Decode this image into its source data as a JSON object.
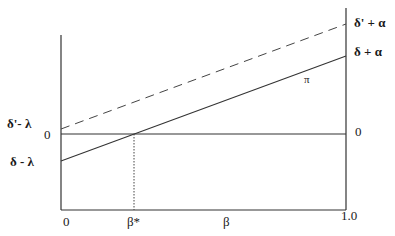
{
  "diagram": {
    "left_labels": {
      "upper": "δ'- λ",
      "zero": "0",
      "lower": "δ - λ"
    },
    "right_labels": {
      "upper": "δ' + α",
      "middle": "δ + α",
      "zero": "0"
    },
    "curve_label": "π",
    "x_axis": {
      "start": "0",
      "marker": "β*",
      "label": "β",
      "end": "1.0"
    },
    "lines": [
      {
        "name": "dashed-line",
        "style": "dashed",
        "from_label": "δ'- λ",
        "to_label": "δ' + α"
      },
      {
        "name": "solid-line-pi",
        "style": "solid",
        "from_label": "δ - λ",
        "to_label": "δ + α"
      },
      {
        "name": "zero-line",
        "style": "solid",
        "from_label": "0",
        "to_label": "0"
      }
    ],
    "colors": {
      "line": "#333333",
      "text": "#1a1a1a",
      "background": "#ffffff"
    }
  }
}
